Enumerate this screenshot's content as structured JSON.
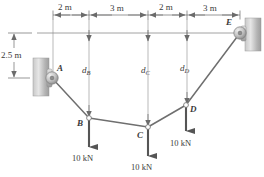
{
  "figure": {
    "colors": {
      "line": "#6b6b6b",
      "cable": "#7a7a7a",
      "arrow": "#5a5a5a",
      "text": "#3a3a3a",
      "wall_light": "#d9d9d9",
      "wall_dark": "#9a9a9a"
    }
  },
  "dimensions": {
    "horizontal": [
      {
        "label": "2 m",
        "x_start": 53,
        "x_end": 89
      },
      {
        "label": "3 m",
        "x_start": 89,
        "x_end": 148
      },
      {
        "label": "2 m",
        "x_start": 148,
        "x_end": 187
      },
      {
        "label": "3 m",
        "x_start": 187,
        "x_end": 240
      }
    ],
    "vertical": [
      {
        "label": "2.5 m",
        "y_start": 33,
        "y_end": 78
      }
    ]
  },
  "sag_labels": [
    {
      "label": "d",
      "sub": "B",
      "x": 82,
      "y": 68
    },
    {
      "label": "d",
      "sub": "C",
      "x": 141,
      "y": 68
    },
    {
      "label": "d",
      "sub": "D",
      "x": 180,
      "y": 66
    }
  ],
  "points": [
    {
      "id": "A",
      "label": "A",
      "x": 52,
      "y": 78,
      "label_x": 57,
      "label_y": 66
    },
    {
      "id": "B",
      "label": "B",
      "x": 89,
      "y": 118,
      "label_x": 77,
      "label_y": 120
    },
    {
      "id": "C",
      "label": "C",
      "x": 148,
      "y": 127,
      "label_x": 137,
      "label_y": 134
    },
    {
      "id": "D",
      "label": "D",
      "x": 186,
      "y": 105,
      "label_x": 190,
      "label_y": 110
    },
    {
      "id": "E",
      "label": "E",
      "x": 240,
      "y": 33,
      "label_x": 228,
      "label_y": 22
    }
  ],
  "loads": [
    {
      "at": "B",
      "label": "10 kN",
      "x": 89,
      "y_from": 118,
      "y_to": 152,
      "text_x": 74,
      "text_y": 158
    },
    {
      "at": "C",
      "label": "10 kN",
      "x": 148,
      "y_from": 127,
      "y_to": 161,
      "text_x": 133,
      "text_y": 167
    },
    {
      "at": "D",
      "label": "10 kN",
      "x": 186,
      "y_from": 105,
      "y_to": 136,
      "text_x": 172,
      "text_y": 142
    }
  ],
  "supports": [
    {
      "id": "A",
      "type": "pin-on-wall",
      "side": "left"
    },
    {
      "id": "E",
      "type": "pin-on-wall",
      "side": "right"
    }
  ]
}
